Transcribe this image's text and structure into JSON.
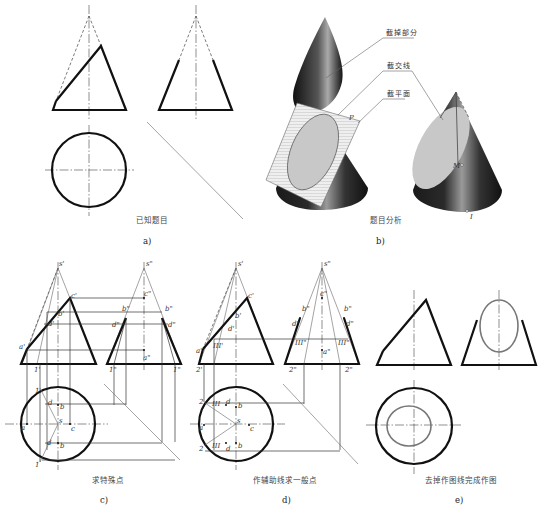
{
  "figure": {
    "panels": [
      {
        "id": "a",
        "caption": "已知题目",
        "sublabel": "a)"
      },
      {
        "id": "b",
        "caption": "题目分析",
        "sublabel": "b)",
        "callouts": [
          "截掉部分",
          "截交线",
          "截平面"
        ],
        "labels": {
          "plane": "P",
          "point_m": "M",
          "point_i": "I"
        }
      },
      {
        "id": "c",
        "caption": "求特殊点",
        "sublabel": "c)",
        "front_labels": [
          "s'",
          "c'",
          "b'",
          "d'",
          "a'",
          "1'"
        ],
        "side_labels": [
          "s\"",
          "c\"",
          "b\"",
          "b\"",
          "d\"",
          "d\"",
          "a\"",
          "1\"",
          "1\""
        ],
        "top_labels": [
          "1",
          "d",
          "b",
          "a",
          "s",
          "c",
          "d",
          "b",
          "1"
        ]
      },
      {
        "id": "d",
        "caption": "作辅助线求一般点",
        "sublabel": "d)",
        "front_labels": [
          "s'",
          "c'",
          "b'",
          "d'",
          "a'",
          "III'",
          "2'"
        ],
        "side_labels": [
          "s\"",
          "c\"",
          "b\"",
          "b\"",
          "d\"",
          "d\"",
          "III\"",
          "III\"",
          "a\"",
          "2\"",
          "2\""
        ],
        "top_labels": [
          "2",
          "III",
          "d",
          "b",
          "a",
          "s",
          "c",
          "III",
          "d",
          "b",
          "2"
        ]
      },
      {
        "id": "e",
        "caption": "去掉作图线完成作图",
        "sublabel": "e)"
      }
    ]
  },
  "colors": {
    "line": "#111111",
    "construction": "#444444",
    "section_curve": "#777777",
    "background": "#ffffff"
  }
}
